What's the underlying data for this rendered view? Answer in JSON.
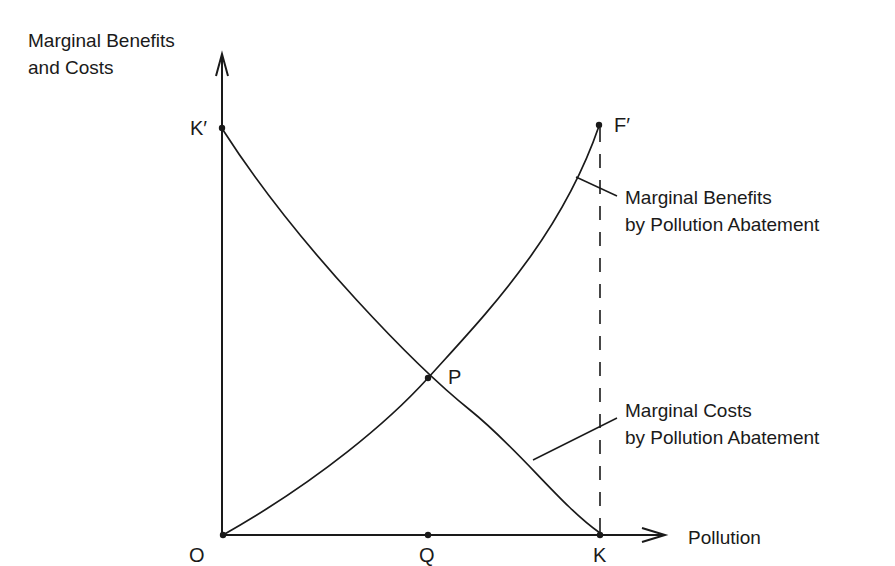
{
  "axes": {
    "y_label_line1": "Marginal Benefits",
    "y_label_line2": "and Costs",
    "x_label": "Pollution"
  },
  "points": {
    "origin": "O",
    "k_prime": "K′",
    "f_prime": "F′",
    "p": "P",
    "q": "Q",
    "k": "K"
  },
  "curves": {
    "benefits_line1": "Marginal Benefits",
    "benefits_line2": "by Pollution Abatement",
    "costs_line1": "Marginal Costs",
    "costs_line2": "by Pollution Abatement"
  },
  "colors": {
    "ink": "#1a1a1a",
    "background": "#ffffff"
  }
}
